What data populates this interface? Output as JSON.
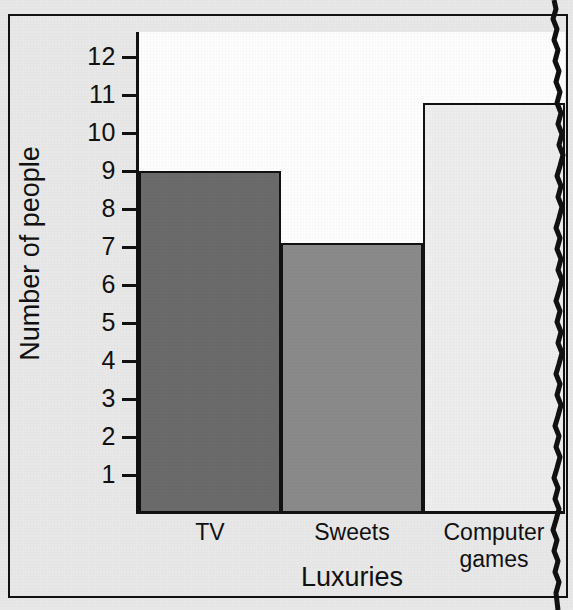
{
  "figure": {
    "kind": "scanned-textbook-bar-chart",
    "paper_color": "#e8e8e8",
    "plot_field_color": "#fdfdfd",
    "ink_color": "#111111"
  },
  "axes": {
    "y_title": "Number of people",
    "x_title": "Luxuries",
    "y_ticks": [
      "1",
      "2",
      "3",
      "4",
      "5",
      "6",
      "7",
      "8",
      "9",
      "10",
      "11",
      "12"
    ],
    "y_min": 0,
    "y_max": 13.1
  },
  "marks": {
    "crop_line_name": "torn-page-edge"
  },
  "chart_data": {
    "type": "bar",
    "title": "",
    "subtitle": "",
    "xlabel": "Luxuries",
    "ylabel": "Number of people",
    "categories": [
      "TV",
      "Sweets",
      "Computer games"
    ],
    "values": [
      9,
      7.1,
      10.8
    ],
    "bar_colors": [
      "#6b6b6b",
      "#8a8a8a",
      "#ededed"
    ],
    "bar_outline": "#111111",
    "ylim": [
      0,
      13.1
    ],
    "ytick_step": 1,
    "yticks": [
      1,
      2,
      3,
      4,
      5,
      6,
      7,
      8,
      9,
      10,
      11,
      12
    ],
    "grid": false,
    "legend": false,
    "legend_position": "none",
    "bars_adjacent": true,
    "annotations": []
  }
}
